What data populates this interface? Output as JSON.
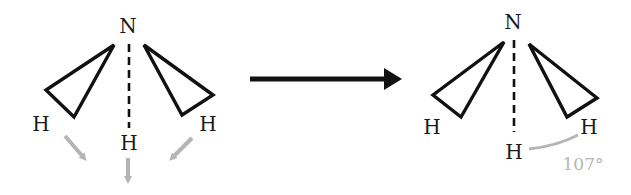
{
  "diagram": {
    "type": "molecular-geometry-transformation",
    "colors": {
      "bond": "#111111",
      "text": "#1a1a1a",
      "annotation": "#b5b5b5",
      "background": "#ffffff"
    },
    "left_molecule": {
      "central_atom": "N",
      "atoms": [
        {
          "label": "H",
          "position": "left",
          "bond": "wedge"
        },
        {
          "label": "H",
          "position": "center",
          "bond": "dashed"
        },
        {
          "label": "H",
          "position": "right",
          "bond": "wedge"
        }
      ],
      "force_arrows": 3
    },
    "reaction_arrow": {
      "direction": "right"
    },
    "right_molecule": {
      "central_atom": "N",
      "atoms": [
        {
          "label": "H",
          "position": "left",
          "bond": "wedge"
        },
        {
          "label": "H",
          "position": "center",
          "bond": "dashed"
        },
        {
          "label": "H",
          "position": "right",
          "bond": "wedge"
        }
      ],
      "bond_angle": "107°"
    }
  }
}
